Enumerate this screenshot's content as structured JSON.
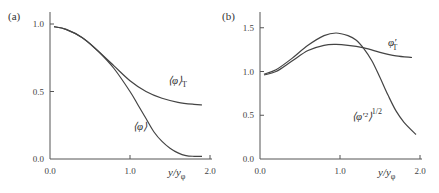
{
  "chart_data": [
    {
      "panel": "(a)",
      "type": "line",
      "title": "",
      "xlabel": "y/y_φ",
      "ylabel": "",
      "xlim": [
        0,
        2.0
      ],
      "ylim": [
        0,
        1.1
      ],
      "xticks": [
        "0.0",
        "1.0",
        "2.0"
      ],
      "yticks": [
        "0.0",
        "0.5",
        "1.0"
      ],
      "grid": false,
      "series": [
        {
          "name": "⟨φ⟩_T",
          "x": [
            0.05,
            0.2,
            0.4,
            0.6,
            0.8,
            1.0,
            1.2,
            1.4,
            1.6,
            1.8,
            1.9
          ],
          "values": [
            0.98,
            0.96,
            0.9,
            0.8,
            0.69,
            0.58,
            0.5,
            0.45,
            0.42,
            0.405,
            0.4
          ]
        },
        {
          "name": "⟨φ⟩",
          "x": [
            0.05,
            0.2,
            0.4,
            0.6,
            0.8,
            1.0,
            1.1,
            1.2,
            1.3,
            1.4,
            1.5,
            1.6,
            1.7,
            1.8,
            1.9
          ],
          "values": [
            0.98,
            0.96,
            0.9,
            0.8,
            0.67,
            0.5,
            0.4,
            0.3,
            0.2,
            0.13,
            0.08,
            0.045,
            0.025,
            0.02,
            0.02
          ]
        }
      ]
    },
    {
      "panel": "(b)",
      "type": "line",
      "title": "",
      "xlabel": "y/y_φ",
      "ylabel": "",
      "xlim": [
        0,
        2.0
      ],
      "ylim": [
        0,
        1.65
      ],
      "xticks": [
        "0.0",
        "1.0",
        "2.0"
      ],
      "yticks": [
        "0.0",
        "0.5",
        "1.0",
        "1.5"
      ],
      "grid": false,
      "series": [
        {
          "name": "φ'_T",
          "x": [
            0.05,
            0.2,
            0.4,
            0.6,
            0.8,
            0.95,
            1.1,
            1.3,
            1.5,
            1.7,
            1.9
          ],
          "values": [
            0.96,
            1.0,
            1.12,
            1.24,
            1.3,
            1.31,
            1.3,
            1.27,
            1.22,
            1.18,
            1.16
          ]
        },
        {
          "name": "⟨φ'²⟩^1/2",
          "x": [
            0.05,
            0.2,
            0.4,
            0.6,
            0.8,
            0.95,
            1.1,
            1.2,
            1.3,
            1.4,
            1.5,
            1.6,
            1.7,
            1.8,
            1.95
          ],
          "values": [
            0.97,
            1.02,
            1.15,
            1.3,
            1.41,
            1.44,
            1.41,
            1.36,
            1.26,
            1.12,
            0.93,
            0.73,
            0.55,
            0.42,
            0.28
          ]
        }
      ]
    }
  ],
  "labels": {
    "a": {
      "panel": "(a)",
      "series1_main": "⟨φ⟩",
      "series1_sub": "T",
      "series2_main": "⟨φ⟩",
      "xlabel_main": "y/y",
      "xlabel_sub": "φ"
    },
    "b": {
      "panel": "(b)",
      "series1_main": "φ′",
      "series1_sub": "T",
      "series2_main": "⟨φ′²⟩",
      "series2_sup": "1/2",
      "xlabel_main": "y/y",
      "xlabel_sub": "φ"
    }
  }
}
